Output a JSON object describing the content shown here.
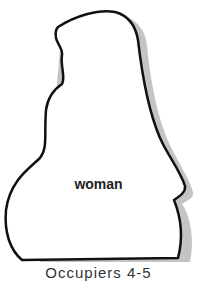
{
  "figure": {
    "label": "woman",
    "caption": "Occupiers 4-5",
    "colors": {
      "outline": "#111111",
      "shadow": "#c4c4c4",
      "fill": "#ffffff"
    }
  }
}
